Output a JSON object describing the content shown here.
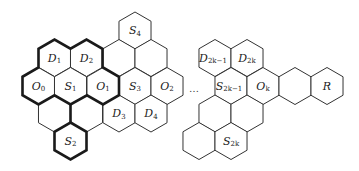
{
  "diagram": {
    "hex_radius": 18.5,
    "cells": [
      {
        "id": "S4",
        "row": 0,
        "cx": 135,
        "label": "S",
        "sub": "4"
      },
      {
        "id": "D1",
        "row": 1,
        "cx": 54.5,
        "label": "D",
        "sub": "1"
      },
      {
        "id": "D2",
        "row": 1,
        "cx": 86.5,
        "label": "D",
        "sub": "2"
      },
      {
        "id": "r1c3",
        "row": 1,
        "cx": 119,
        "label": "",
        "sub": ""
      },
      {
        "id": "r1c4",
        "row": 1,
        "cx": 151,
        "label": "",
        "sub": ""
      },
      {
        "id": "D2k-1",
        "row": 1,
        "cx": 215,
        "label": "D",
        "sub": "2k−1"
      },
      {
        "id": "D2k",
        "row": 1,
        "cx": 247,
        "label": "D",
        "sub": "2k"
      },
      {
        "id": "O0",
        "row": 2,
        "cx": 38.5,
        "label": "O",
        "sub": "0"
      },
      {
        "id": "S1",
        "row": 2,
        "cx": 70.5,
        "label": "S",
        "sub": "1"
      },
      {
        "id": "O1",
        "row": 2,
        "cx": 103,
        "label": "O",
        "sub": "1"
      },
      {
        "id": "S3",
        "row": 2,
        "cx": 135,
        "label": "S",
        "sub": "3"
      },
      {
        "id": "O2",
        "row": 2,
        "cx": 167,
        "label": "O",
        "sub": "2"
      },
      {
        "id": "S2k-1",
        "row": 2,
        "cx": 231,
        "label": "S",
        "sub": "2k−1"
      },
      {
        "id": "Ok",
        "row": 2,
        "cx": 263,
        "label": "O",
        "sub": "k"
      },
      {
        "id": "r2c8",
        "row": 2,
        "cx": 295,
        "label": "",
        "sub": ""
      },
      {
        "id": "R",
        "row": 2,
        "cx": 327,
        "label": "R",
        "sub": ""
      },
      {
        "id": "r3c1",
        "row": 3,
        "cx": 54.5,
        "label": "",
        "sub": ""
      },
      {
        "id": "r3c2",
        "row": 3,
        "cx": 86.5,
        "label": "",
        "sub": ""
      },
      {
        "id": "D3",
        "row": 3,
        "cx": 119,
        "label": "D",
        "sub": "3"
      },
      {
        "id": "D4",
        "row": 3,
        "cx": 151,
        "label": "D",
        "sub": "4"
      },
      {
        "id": "r3c5",
        "row": 3,
        "cx": 215,
        "label": "",
        "sub": ""
      },
      {
        "id": "r3c6",
        "row": 3,
        "cx": 247,
        "label": "",
        "sub": ""
      },
      {
        "id": "S2",
        "row": 4,
        "cx": 70.5,
        "label": "S",
        "sub": "2"
      },
      {
        "id": "r4c2",
        "row": 4,
        "cx": 199,
        "label": "",
        "sub": ""
      },
      {
        "id": "S2k",
        "row": 4,
        "cx": 231,
        "label": "S",
        "sub": "2k"
      }
    ],
    "row_y": [
      30.5,
      58,
      86,
      113.5,
      141
    ],
    "ellipsis": "…",
    "highlighted_region": [
      "D1",
      "D2",
      "O0",
      "S1",
      "O1",
      "S2"
    ]
  }
}
